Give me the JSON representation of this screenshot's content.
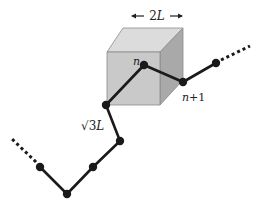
{
  "diagram": {
    "type": "polymer-chain-with-cube",
    "colors": {
      "cube_front": "#c9c9c9",
      "cube_top": "#dcdcdc",
      "cube_right": "#a9a9a9",
      "cube_edge": "#8a8a8a",
      "chain": "#1a1a1a",
      "node": "#1a1a1a"
    },
    "labels": {
      "cube_width": "2L",
      "cube_width_num": "2",
      "cube_width_var": "L",
      "bond_length": "√3L",
      "bond_sqrt": "√",
      "bond_num": "3",
      "bond_var": "L",
      "node_n": "n",
      "node_n1_var": "n",
      "node_n1_rest": "+1"
    },
    "nodes": [
      {
        "x": 40,
        "y": 167
      },
      {
        "x": 67,
        "y": 194
      },
      {
        "x": 93,
        "y": 167
      },
      {
        "x": 120,
        "y": 141
      },
      {
        "x": 106,
        "y": 105
      },
      {
        "x": 144,
        "y": 65
      },
      {
        "x": 183,
        "y": 82
      },
      {
        "x": 216,
        "y": 63
      }
    ],
    "dotted_ends": [
      {
        "from": {
          "x": 36,
          "y": 162
        },
        "to": {
          "x": 12,
          "y": 139
        }
      },
      {
        "from": {
          "x": 221,
          "y": 60
        },
        "to": {
          "x": 250,
          "y": 46
        }
      }
    ]
  }
}
